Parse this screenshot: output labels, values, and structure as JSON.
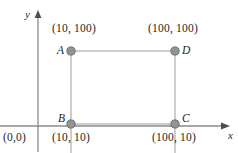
{
  "figure": {
    "type": "coordinate-rectangle-diagram",
    "colors": {
      "axis": "#8a8a8a",
      "edge": "#b8b8b8",
      "dot_fill": "#949494",
      "dot_stroke": "#6e6e6e",
      "text": "#231f20",
      "background": "#ffffff"
    },
    "axes": {
      "x_label": "x",
      "y_label": "y",
      "origin_label": "(0,0)"
    },
    "points": [
      {
        "id": "A",
        "letter": "A",
        "coord_label": "(10, 100)",
        "x": 10,
        "y": 100
      },
      {
        "id": "D",
        "letter": "D",
        "coord_label": "(100, 100)",
        "x": 100,
        "y": 100
      },
      {
        "id": "B",
        "letter": "B",
        "coord_label": "(10, 10)",
        "x": 10,
        "y": 10
      },
      {
        "id": "C",
        "letter": "C",
        "coord_label": "(100, 10)",
        "x": 100,
        "y": 10
      }
    ]
  }
}
